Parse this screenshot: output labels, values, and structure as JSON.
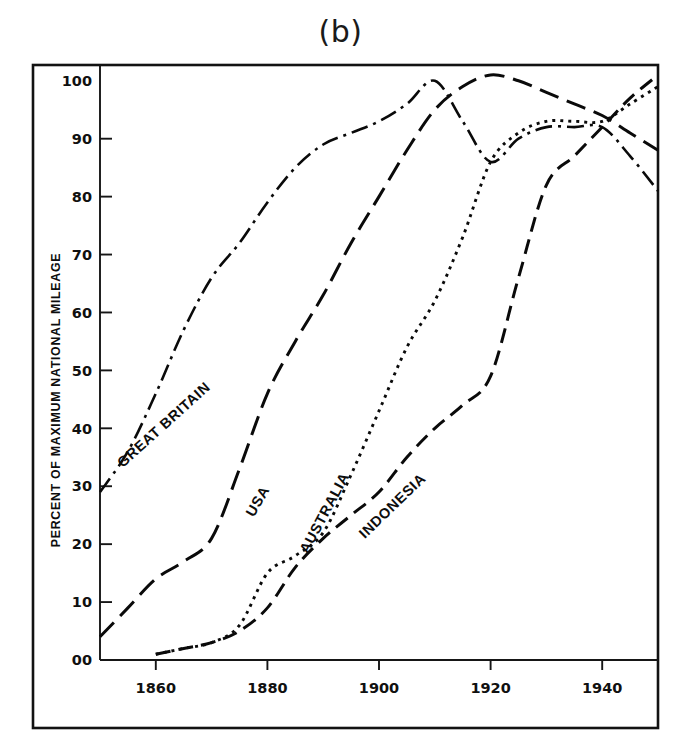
{
  "figure": {
    "title": "(b)"
  },
  "chart_data": {
    "type": "line",
    "title": "(b)",
    "xlabel": "",
    "ylabel": "PERCENT OF MAXIMUM NATIONAL MILEAGE",
    "xlim": [
      1850,
      1950
    ],
    "ylim": [
      0,
      103
    ],
    "grid": false,
    "legend_position": "inline-labels",
    "x_ticks": [
      1860,
      1880,
      1900,
      1920,
      1940
    ],
    "x_tick_labels": [
      "1860",
      "1880",
      "1900",
      "1920",
      "1940"
    ],
    "y_ticks": [
      0,
      10,
      20,
      30,
      40,
      50,
      60,
      70,
      80,
      90,
      100
    ],
    "y_tick_labels": [
      "00",
      "10",
      "20",
      "30",
      "40",
      "50",
      "60",
      "70",
      "80",
      "90",
      "100"
    ],
    "series": [
      {
        "name": "GREAT BRITAIN",
        "line_style": "dash-dot",
        "label_x": 1862,
        "label_y": 40,
        "label_rotation": -42,
        "x": [
          1850,
          1855,
          1860,
          1865,
          1870,
          1875,
          1880,
          1885,
          1890,
          1895,
          1900,
          1905,
          1910,
          1915,
          1920,
          1925,
          1930,
          1935,
          1940,
          1945,
          1950
        ],
        "y": [
          29,
          36,
          46,
          57,
          66,
          72,
          79,
          85,
          89,
          91,
          93,
          96,
          100,
          93,
          86,
          90,
          92,
          92,
          92,
          87,
          81
        ]
      },
      {
        "name": "USA",
        "line_style": "long-dash",
        "label_x": 1879,
        "label_y": 27,
        "label_rotation": -60,
        "x": [
          1850,
          1855,
          1860,
          1865,
          1870,
          1875,
          1880,
          1885,
          1890,
          1895,
          1900,
          1905,
          1910,
          1915,
          1920,
          1925,
          1930,
          1935,
          1940,
          1945,
          1950
        ],
        "y": [
          4,
          9,
          14,
          17,
          21,
          33,
          46,
          55,
          63,
          72,
          80,
          88,
          95,
          99,
          101,
          100,
          98,
          96,
          94,
          91,
          88
        ]
      },
      {
        "name": "AUSTRALIA",
        "line_style": "dotted",
        "label_x": 1891,
        "label_y": 25,
        "label_rotation": -62,
        "x": [
          1860,
          1865,
          1870,
          1875,
          1880,
          1885,
          1890,
          1895,
          1900,
          1905,
          1910,
          1915,
          1920,
          1925,
          1930,
          1935,
          1940,
          1945,
          1950
        ],
        "y": [
          1,
          2,
          3,
          6,
          15,
          18,
          22,
          32,
          43,
          54,
          62,
          73,
          86,
          91,
          93,
          93,
          93,
          96,
          99
        ]
      },
      {
        "name": "INDONESIA",
        "line_style": "dash",
        "label_x": 1903,
        "label_y": 26,
        "label_rotation": -44,
        "x": [
          1860,
          1865,
          1870,
          1875,
          1880,
          1885,
          1890,
          1895,
          1900,
          1905,
          1910,
          1915,
          1920,
          1925,
          1930,
          1935,
          1940,
          1945,
          1950
        ],
        "y": [
          1,
          2,
          3,
          5,
          9,
          16,
          21,
          25,
          29,
          35,
          40,
          44,
          49,
          66,
          82,
          87,
          92,
          97,
          101
        ]
      }
    ]
  },
  "colors": {
    "ink": "#0a0a0a",
    "background": "#ffffff"
  }
}
